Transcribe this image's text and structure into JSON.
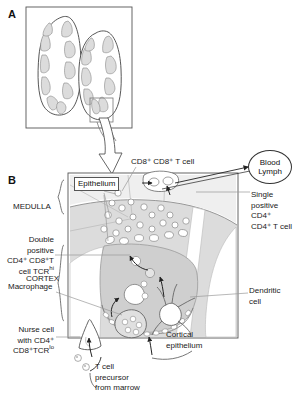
{
  "figure": {
    "panels": [
      {
        "letter": "A",
        "name": "thymus-lobes-overview"
      },
      {
        "letter": "B",
        "name": "thymic-lobule-detail"
      }
    ]
  },
  "panel_a": {
    "letter": "A",
    "description": "Two thymus lobes in cross section with lobulated cortex regions",
    "lobe_count": 2
  },
  "panel_b": {
    "letter": "B",
    "epithelium_label": "Epithelium",
    "blood_lymph": {
      "line1": "Blood",
      "line2": "Lymph"
    },
    "labels": {
      "cd8_t_cell": "CD8⁺ CD8⁺ T cell",
      "medulla": "MEDULLA",
      "cortex": "CORTEX",
      "double_positive_l1": "Double",
      "double_positive_l2": "positive",
      "double_positive_l3": "CD4⁺ CD8⁺T",
      "double_positive_l4": "cell TCR",
      "double_positive_sup": "hi",
      "macrophage": "Macrophage",
      "nurse_cell_l1": "Nurse cell",
      "nurse_cell_l2": "with CD4⁺",
      "nurse_cell_l3": "CD8⁺TCR",
      "nurse_cell_sup": "lo",
      "single_positive_l1": "Single",
      "single_positive_l2": "positive",
      "single_positive_l3": "CD4⁺",
      "single_positive_l4": "CD4⁺ T cell",
      "dendritic_cell_l1": "Dendritic",
      "dendritic_cell_l2": "cell",
      "cortical_epithelium_l1": "Cortical",
      "cortical_epithelium_l2": "epithelium",
      "t_cell_precursor_l1": "T cell",
      "t_cell_precursor_l2": "precursor",
      "t_cell_precursor_l3": "from marrow"
    }
  },
  "colors": {
    "stroke": "#4a4a4a",
    "stroke_dark": "#333333",
    "fill_light": "#e8e8e8",
    "fill_mid": "#d4d4d4",
    "fill_pale": "#f2f2f2",
    "background": "#ffffff",
    "text": "#1a1a1a"
  }
}
